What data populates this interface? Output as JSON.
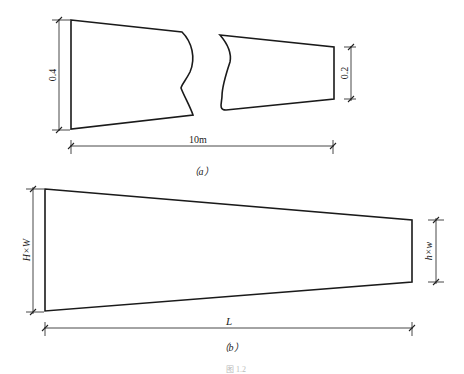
{
  "figure": {
    "caption": "图 1.2",
    "panel_a": {
      "label": "（a）",
      "left_height_label": "0.4",
      "right_height_label": "0.2",
      "length_label": "10m"
    },
    "panel_b": {
      "label": "（b）",
      "left_section_label": "H×W",
      "right_section_label": "h×w",
      "length_label": "L"
    },
    "colors": {
      "stroke": "#1a1a1a",
      "background": "#ffffff"
    }
  }
}
